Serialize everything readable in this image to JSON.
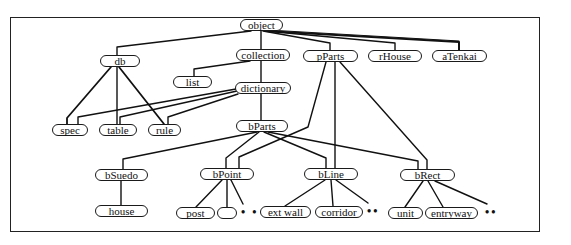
{
  "diagram": {
    "type": "class-hierarchy",
    "nodes": {
      "object": {
        "label": "object",
        "x": 240,
        "y": 19,
        "w": 43
      },
      "db": {
        "label": "db",
        "x": 100,
        "y": 55,
        "w": 40
      },
      "collection": {
        "label": "collection",
        "x": 236,
        "y": 49,
        "w": 54
      },
      "pParts": {
        "label": "pParts",
        "x": 303,
        "y": 50,
        "w": 55
      },
      "rHouse": {
        "label": "rHouse",
        "x": 368,
        "y": 50,
        "w": 54
      },
      "aTenkai": {
        "label": "aTenkai",
        "x": 432,
        "y": 50,
        "w": 55
      },
      "list": {
        "label": "list",
        "x": 173,
        "y": 76,
        "w": 39
      },
      "dictionary": {
        "label": "dictionary",
        "x": 235,
        "y": 82,
        "w": 56
      },
      "spec": {
        "label": "spec",
        "x": 52,
        "y": 124,
        "w": 36
      },
      "table": {
        "label": "table",
        "x": 99,
        "y": 124,
        "w": 38
      },
      "rule": {
        "label": "rule",
        "x": 148,
        "y": 124,
        "w": 33
      },
      "bParts": {
        "label": "bParts",
        "x": 236,
        "y": 120,
        "w": 52
      },
      "bSuedo": {
        "label": "bSuedo",
        "x": 95,
        "y": 169,
        "w": 53
      },
      "bPoint": {
        "label": "bPoint",
        "x": 200,
        "y": 168,
        "w": 54
      },
      "bLine": {
        "label": "bLine",
        "x": 304,
        "y": 168,
        "w": 54
      },
      "bRect": {
        "label": "bRect",
        "x": 400,
        "y": 169,
        "w": 55
      },
      "house": {
        "label": "house",
        "x": 95,
        "y": 205,
        "w": 53
      },
      "post": {
        "label": "post",
        "x": 176,
        "y": 207,
        "w": 39
      },
      "blank": {
        "label": "",
        "x": 217,
        "y": 207,
        "w": 20
      },
      "ext_wall": {
        "label": "ext wall",
        "x": 260,
        "y": 206,
        "w": 51
      },
      "corridor": {
        "label": "corridor",
        "x": 315,
        "y": 206,
        "w": 48
      },
      "unit": {
        "label": "unit",
        "x": 388,
        "y": 207,
        "w": 35
      },
      "entryway": {
        "label": "entryway",
        "x": 425,
        "y": 207,
        "w": 53
      }
    },
    "ellipses": [
      {
        "after": "bPoint children",
        "text": "• •",
        "x": 241,
        "y": 206
      },
      {
        "after": "bLine children",
        "text": "••",
        "x": 367,
        "y": 205
      },
      {
        "after": "bRect children",
        "text": "••",
        "x": 485,
        "y": 206
      }
    ],
    "edges": [
      [
        "object",
        "db"
      ],
      [
        "object",
        "collection"
      ],
      [
        "object",
        "pParts"
      ],
      [
        "object",
        "rHouse"
      ],
      [
        "object",
        "aTenkai"
      ],
      [
        "collection",
        "list"
      ],
      [
        "collection",
        "dictionary"
      ],
      [
        "dictionary",
        "bParts"
      ],
      [
        "db",
        "spec"
      ],
      [
        "db",
        "table"
      ],
      [
        "db",
        "rule"
      ],
      [
        "dictionary",
        "spec"
      ],
      [
        "dictionary",
        "table"
      ],
      [
        "dictionary",
        "rule"
      ],
      [
        "bParts",
        "bSuedo"
      ],
      [
        "bParts",
        "bPoint"
      ],
      [
        "bParts",
        "bLine"
      ],
      [
        "bParts",
        "bRect"
      ],
      [
        "pParts",
        "bPoint"
      ],
      [
        "pParts",
        "bLine"
      ],
      [
        "pParts",
        "bRect"
      ],
      [
        "bSuedo",
        "house"
      ],
      [
        "bPoint",
        "post"
      ],
      [
        "bPoint",
        "blank"
      ],
      [
        "bLine",
        "ext_wall"
      ],
      [
        "bLine",
        "corridor"
      ],
      [
        "bRect",
        "unit"
      ],
      [
        "bRect",
        "entryway"
      ]
    ]
  }
}
